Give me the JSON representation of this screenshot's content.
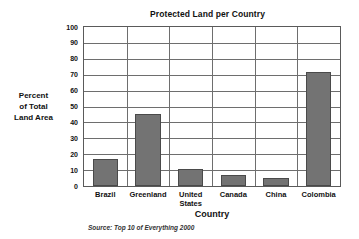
{
  "chart_data": {
    "type": "bar",
    "title": "Protected Land per Country",
    "xlabel": "Country",
    "ylabel": "Percent of Total Land Area",
    "ylabel_lines": [
      "Percent",
      "of Total",
      "Land Area"
    ],
    "categories": [
      "Brazil",
      "Greenland",
      "United States",
      "Canada",
      "China",
      "Colombia"
    ],
    "category_lines": [
      [
        "Brazil"
      ],
      [
        "Greenland"
      ],
      [
        "United",
        "States"
      ],
      [
        "Canada"
      ],
      [
        "China"
      ],
      [
        "Colombia"
      ]
    ],
    "values": [
      17,
      45,
      11,
      7,
      5,
      72
    ],
    "ylim": [
      0,
      100
    ],
    "yticks": [
      0,
      10,
      20,
      30,
      40,
      50,
      60,
      70,
      80,
      90,
      100
    ],
    "ytick_labels": [
      "0",
      "10",
      "20",
      "30",
      "40",
      "50",
      "60",
      "70",
      "80",
      "90",
      "100"
    ],
    "grid": true,
    "legend": false,
    "bar_color": "#737373",
    "bar_edge_color": "#4a4a4a",
    "grid_color": "#6e6e6e",
    "axis_color": "#5a5a5a",
    "background": "#ffffff",
    "source": "Source: Top 10 of Everything 2000"
  }
}
